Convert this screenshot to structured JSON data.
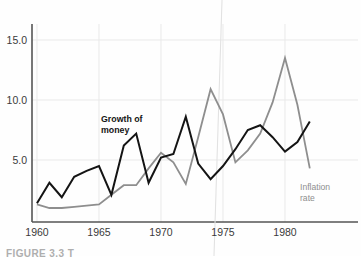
{
  "figure": {
    "caption": "FIGURE 3.3   T",
    "background_color": "#fefefe"
  },
  "axes": {
    "y_ticks": [
      "5.0",
      "10.0",
      "15.0"
    ],
    "x_ticks": [
      "1960",
      "1965",
      "1970",
      "1975",
      "1980"
    ],
    "axis_color": "#555555",
    "gridline_color": "#e9e9e9"
  },
  "annotations": {
    "money_label_line1": "Growth of",
    "money_label_line2": "money",
    "inflation_label_line1": "Inflation",
    "inflation_label_line2": "rate"
  },
  "chart_data": {
    "type": "line",
    "title": "",
    "subtitle": "",
    "xlabel": "",
    "ylabel": "",
    "xlim": [
      1960,
      1982
    ],
    "ylim": [
      0.8,
      16.5
    ],
    "yticks": [
      5.0,
      10.0,
      15.0
    ],
    "xticks": [
      1960,
      1965,
      1970,
      1975,
      1980
    ],
    "grid": true,
    "legend_position": "inline-annotation",
    "x": [
      1960,
      1961,
      1962,
      1963,
      1964,
      1965,
      1966,
      1967,
      1968,
      1969,
      1970,
      1971,
      1972,
      1973,
      1974,
      1975,
      1976,
      1977,
      1978,
      1979,
      1980,
      1981,
      1982
    ],
    "series": [
      {
        "name": "Growth of money",
        "color": "#141414",
        "values": [
          1.4,
          3.1,
          1.9,
          3.6,
          4.1,
          4.5,
          2.1,
          6.2,
          7.2,
          3.1,
          5.2,
          5.5,
          8.6,
          4.7,
          3.4,
          4.5,
          5.9,
          7.5,
          7.9,
          6.9,
          5.7,
          6.5,
          8.2
        ]
      },
      {
        "name": "Inflation rate",
        "color": "#8e8e8e",
        "values": [
          1.3,
          1.0,
          1.0,
          1.1,
          1.2,
          1.3,
          2.1,
          2.9,
          2.9,
          4.3,
          5.6,
          4.8,
          3.0,
          6.9,
          10.9,
          8.8,
          4.8,
          5.8,
          7.2,
          9.8,
          13.5,
          9.6,
          4.3
        ]
      }
    ]
  }
}
